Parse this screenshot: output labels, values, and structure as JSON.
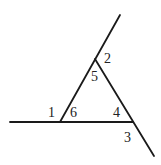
{
  "diagram": {
    "type": "geometry-angles",
    "lines": [
      {
        "name": "horizontal-line",
        "x1": 10,
        "y1": 122,
        "x2": 133,
        "y2": 122
      },
      {
        "name": "left-slanted-line",
        "x1": 60,
        "y1": 122,
        "x2": 120,
        "y2": 15
      },
      {
        "name": "right-slanted-line",
        "x1": 95,
        "y1": 59,
        "x2": 154,
        "y2": 156
      }
    ],
    "vertices": {
      "top": [
        95,
        59
      ],
      "left": [
        60,
        122
      ],
      "right": [
        133,
        122
      ]
    },
    "angle_labels": [
      {
        "id": "1",
        "x": 48,
        "y": 117
      },
      {
        "id": "2",
        "x": 104,
        "y": 63
      },
      {
        "id": "3",
        "x": 124,
        "y": 142
      },
      {
        "id": "4",
        "x": 113,
        "y": 117
      },
      {
        "id": "5",
        "x": 91,
        "y": 81
      },
      {
        "id": "6",
        "x": 70,
        "y": 117
      }
    ]
  }
}
